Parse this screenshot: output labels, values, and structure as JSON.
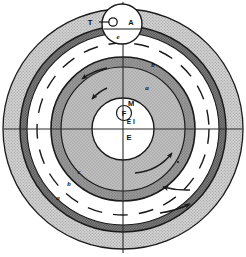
{
  "figure": {
    "background_color": "#ffffff",
    "width": 246,
    "height": 257
  },
  "colors": {
    "outline": "#1a1a1a",
    "outer_shell_fill": "#c9c9c9",
    "dark_band_fill": "#6f6f6f",
    "white_gap_fill": "#ffffff",
    "mid_band_fill": "#8c8c8c",
    "inner_zone_fill": "#b5b5b5",
    "core_fill": "#ffffff",
    "label_color": "#111111",
    "axis_color": "#2b2b2b"
  },
  "shells": [
    {
      "id": "outer-shell",
      "label": "a",
      "label_position": {
        "x": 68,
        "y": 196
      },
      "fill": "#c9c9c9",
      "radius": 120,
      "description": "outermost light stippled shell"
    },
    {
      "id": "dark-band",
      "label": "b",
      "label_position": {
        "x": 86,
        "y": 178
      },
      "fill": "#6f6f6f",
      "radius": 103,
      "description": "dark hatched band"
    },
    {
      "id": "white-gap",
      "label": "c",
      "label_position": {
        "x": 97,
        "y": 170
      },
      "fill": "#ffffff",
      "radius": 97,
      "description": "white annular gap with dashed arcs"
    },
    {
      "id": "mid-band",
      "label": "b",
      "label_position": {
        "x": 152,
        "y": 65
      },
      "fill": "#8c8c8c",
      "radius": 72,
      "description": "mid gray band upper right"
    },
    {
      "id": "inner-zone",
      "label": "a",
      "label_position": {
        "x": 146,
        "y": 88
      },
      "fill": "#b5b5b5",
      "radius": 62,
      "description": "inner gray zone"
    }
  ],
  "core": {
    "id": "core-circle",
    "radius": 31,
    "fill": "#ffffff",
    "labels": [
      {
        "text": "M",
        "x": 131,
        "y": 104
      },
      {
        "text": "F",
        "x": 127,
        "y": 114
      },
      {
        "text": "E",
        "x": 130,
        "y": 122
      },
      {
        "text": "I",
        "x": 135,
        "y": 122
      },
      {
        "text": "E",
        "x": 130,
        "y": 134
      }
    ],
    "inner_marker_radius": 7
  },
  "inset": {
    "id": "top-inset-circle",
    "center": {
      "x": 122,
      "y": 24
    },
    "radius": 20,
    "fill": "#ffffff",
    "labels": [
      {
        "text": "T",
        "x": 92,
        "y": 26,
        "kind": "leader"
      },
      {
        "text": "A",
        "x": 130,
        "y": 25,
        "kind": "sector"
      },
      {
        "text": "e",
        "x": 118,
        "y": 38,
        "kind": "sector"
      }
    ],
    "leader_line": {
      "x1": 98,
      "y1": 23,
      "x2": 110,
      "y2": 23
    },
    "marker_circle": {
      "cx": 113,
      "cy": 23,
      "r": 4
    }
  },
  "axes": {
    "vertical": {
      "x": 123,
      "y1": 2,
      "y2": 252
    },
    "horizontal": {
      "y": 129,
      "x1": 4,
      "x2": 242
    },
    "color": "#2b2b2b"
  },
  "arrows": [
    {
      "id": "arrow-inner-upper-left",
      "description": "counterclockwise flow arrow inner band upper left"
    },
    {
      "id": "arrow-mid-upper-left",
      "description": "counterclockwise flow arrow mid band upper left"
    },
    {
      "id": "arrow-inner-lower-right",
      "description": "flow arrow inner region lower right"
    },
    {
      "id": "arrow-dark-band-lower-right",
      "description": "flow arrow dark band lower right"
    },
    {
      "id": "arrow-outer-lower-right",
      "description": "flow arrow outer shell lower right"
    }
  ],
  "dashed_arcs": {
    "id": "dashed-circle",
    "radius": 86,
    "description": "dashed circle within white annular gap"
  },
  "legend_keys": [
    "a",
    "b",
    "c",
    "A",
    "T",
    "e",
    "M",
    "F",
    "E",
    "I"
  ]
}
